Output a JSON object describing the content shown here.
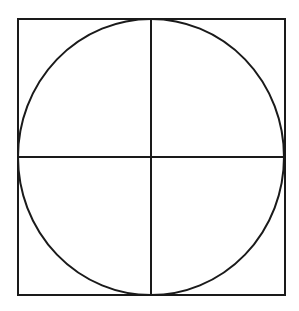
{
  "diagram": {
    "stroke_color": "#1a1a1a",
    "background": "#ffffff",
    "square": {
      "x": 18,
      "y": 19,
      "width": 267,
      "height": 276
    },
    "circle": {
      "cx": 151,
      "cy": 157,
      "rx": 133,
      "ry": 138
    },
    "vertical_line": {
      "x": 151,
      "y1": 19,
      "y2": 295
    },
    "horizontal_line": {
      "y": 157,
      "x1": 18,
      "x2": 285
    }
  }
}
